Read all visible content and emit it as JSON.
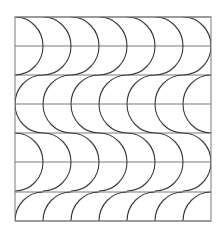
{
  "figure": {
    "type": "tessellation-pattern",
    "frame": {
      "x": 15,
      "y": 17,
      "width": 196,
      "height": 204
    },
    "columns": 7,
    "horizontal_lines_y": [
      17,
      46,
      75,
      104,
      133,
      162,
      192,
      221
    ],
    "arc_bands": [
      {
        "center_y": 46,
        "direction": "right"
      },
      {
        "center_y": 104,
        "direction": "left"
      },
      {
        "center_y": 162,
        "direction": "right"
      },
      {
        "center_y": 221,
        "direction": "left"
      }
    ],
    "arc_radius_x": 28,
    "arc_radius_y": 29,
    "colors": {
      "arc": "#3a3a3a",
      "grid": "#7a7a7a",
      "background": "#ffffff"
    }
  }
}
